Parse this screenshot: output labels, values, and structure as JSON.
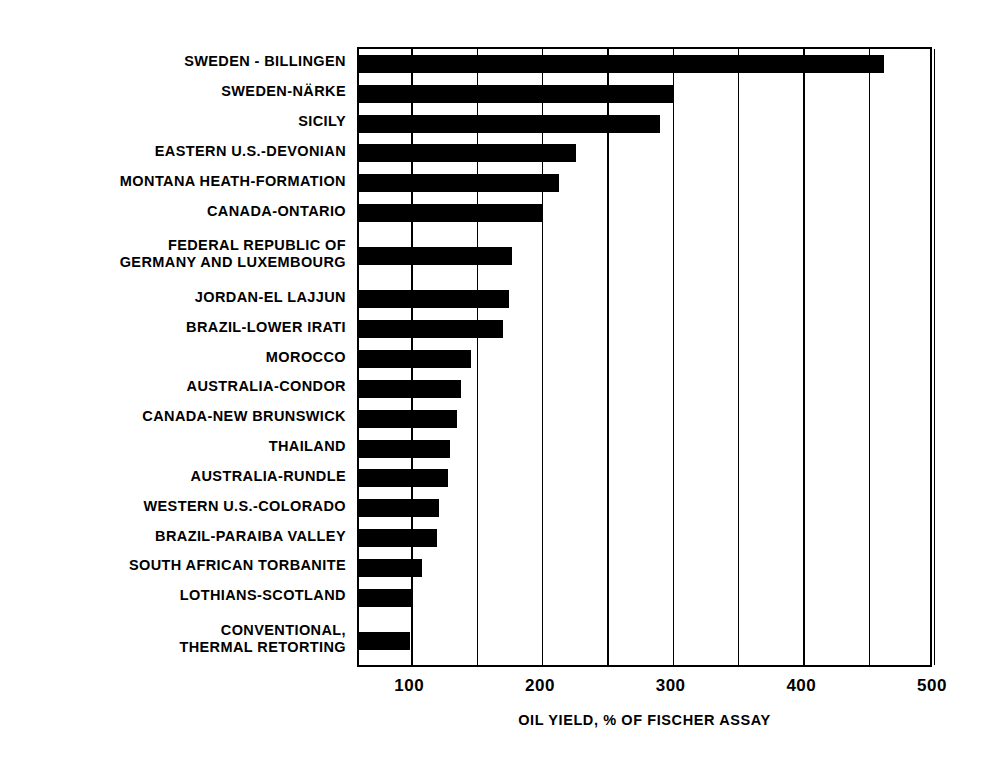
{
  "chart_data": {
    "type": "bar",
    "orientation": "horizontal",
    "title": "",
    "xlabel": "OIL YIELD, % OF FISCHER ASSAY",
    "ylabel": "",
    "xlim": [
      60,
      500
    ],
    "xticks": [
      100,
      200,
      300,
      400,
      500
    ],
    "xtick_labels": [
      "100",
      "200",
      "300",
      "400",
      "500"
    ],
    "minor_gridlines": [
      100,
      150,
      200,
      250,
      300,
      350,
      400,
      450,
      500
    ],
    "grid": true,
    "legend": "none",
    "bar_color": "#000000",
    "background_color": "#ffffff",
    "categories": [
      "SWEDEN - BILLINGEN",
      "SWEDEN-NÄRKE",
      "SICILY",
      "EASTERN U.S.-DEVONIAN",
      "MONTANA HEATH-FORMATION",
      "CANADA-ONTARIO",
      "FEDERAL REPUBLIC OF\nGERMANY AND LUXEMBOURG",
      "JORDAN-EL LAJJUN",
      "BRAZIL-LOWER IRATI",
      "MOROCCO",
      "AUSTRALIA-CONDOR",
      "CANADA-NEW BRUNSWICK",
      "THAILAND",
      "AUSTRALIA-RUNDLE",
      "WESTERN U.S.-COLORADO",
      "BRAZIL-PARAIBA VALLEY",
      "SOUTH AFRICAN TORBANITE",
      "LOTHIANS-SCOTLAND",
      "CONVENTIONAL,\nTHERMAL RETORTING"
    ],
    "values": [
      462,
      300,
      290,
      226,
      213,
      201,
      177,
      175,
      170,
      146,
      138,
      135,
      130,
      128,
      121,
      120,
      108,
      100,
      99
    ]
  }
}
